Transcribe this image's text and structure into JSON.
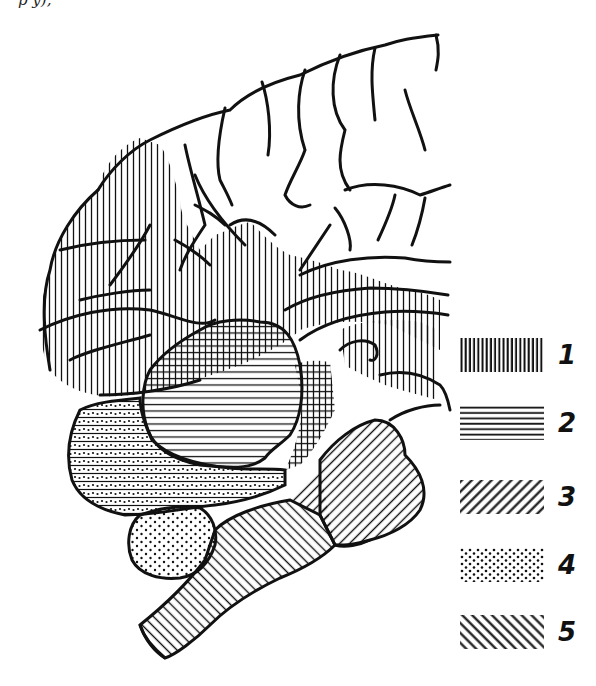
{
  "figure": {
    "cropped_caption_fragment": "p            y),",
    "stroke_color": "#111111",
    "background_color": "#ffffff"
  },
  "regions": [
    {
      "id": "cortex-frontal-temporal",
      "pattern": 1
    },
    {
      "id": "thalamus-region",
      "pattern": 2
    },
    {
      "id": "temporal-lower",
      "pattern": 2
    },
    {
      "id": "cerebellum",
      "pattern": 4
    },
    {
      "id": "pons-medulla",
      "pattern": 5
    },
    {
      "id": "midbrain-posterior",
      "pattern": 3
    }
  ],
  "legend": {
    "items": [
      {
        "number": "1",
        "pattern": "vertical-lines"
      },
      {
        "number": "2",
        "pattern": "horizontal-lines"
      },
      {
        "number": "3",
        "pattern": "diagonal-forward"
      },
      {
        "number": "4",
        "pattern": "dots"
      },
      {
        "number": "5",
        "pattern": "diagonal-backward"
      }
    ]
  }
}
